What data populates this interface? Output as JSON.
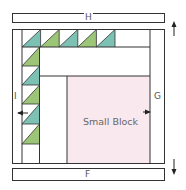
{
  "diagram": {
    "type": "quilt-assembly",
    "colors": {
      "outline": "#333333",
      "teal": "#7cc1b3",
      "green": "#9cc578",
      "pink": "#f9e9ef",
      "white": "#ffffff",
      "label": "#555555"
    },
    "labels": {
      "top_strip": "H",
      "bottom_strip": "F",
      "left_strip": "I",
      "right_strip": "G",
      "center_block": "Small Block"
    },
    "arrows": {
      "top_right": "up",
      "bottom_right": "down",
      "left": "left",
      "right": "right"
    },
    "top_row_triangles": [
      "teal",
      "green",
      "teal",
      "green",
      "teal"
    ],
    "left_column_triangles": [
      "green",
      "teal",
      "green",
      "teal",
      "green"
    ]
  }
}
